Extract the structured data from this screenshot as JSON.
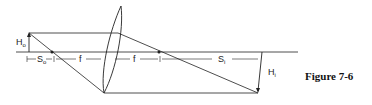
{
  "diagram": {
    "type": "thin lens ray diagram",
    "labels": {
      "object_height": "H",
      "object_height_sub": "o",
      "object_distance": "S",
      "object_distance_sub": "o",
      "focal_left": "f",
      "focal_right": "f",
      "image_distance": "S",
      "image_distance_sub": "i",
      "image_height": "H",
      "image_height_sub": "i"
    },
    "caption": "Figure 7-6",
    "colors": {
      "line": "#222222",
      "background": "#ffffff"
    }
  }
}
